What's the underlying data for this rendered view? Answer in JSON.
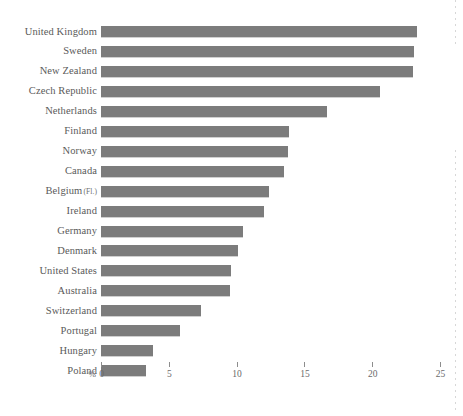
{
  "chart_data": {
    "type": "bar",
    "orientation": "horizontal",
    "title": "",
    "subtitle": "",
    "xlabel": "%",
    "ylabel": "",
    "xlim": [
      0,
      25
    ],
    "xticks": [
      0,
      5,
      10,
      15,
      20,
      25
    ],
    "xtick_labels": [
      "0",
      "5",
      "10",
      "15",
      "20",
      "25"
    ],
    "grid": false,
    "legend": null,
    "bar_color": "#7c7c7c",
    "categories": [
      "United Kingdom",
      "Sweden",
      "New Zealand",
      "Czech Republic",
      "Netherlands",
      "Finland",
      "Norway",
      "Canada",
      "Belgium (Fl.)",
      "Ireland",
      "Germany",
      "Denmark",
      "United States",
      "Australia",
      "Switzerland",
      "Portugal",
      "Hungary",
      "Poland"
    ],
    "values": [
      23.3,
      23.1,
      23.0,
      20.6,
      16.7,
      13.9,
      13.8,
      13.5,
      12.4,
      12.0,
      10.5,
      10.1,
      9.6,
      9.5,
      7.4,
      5.8,
      3.8,
      3.3
    ],
    "category_annotations": {
      "Belgium (Fl.)": {
        "main": "Belgium",
        "sub": "(Fl.)"
      }
    }
  },
  "axis": {
    "unit_symbol": "%"
  }
}
